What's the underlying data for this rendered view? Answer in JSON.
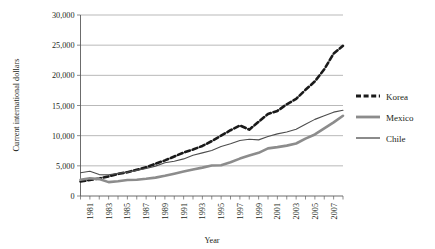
{
  "chart_data": {
    "type": "line",
    "title": "",
    "xlabel": "Year",
    "ylabel": "Current international dollars",
    "xlim": [
      1980,
      2008
    ],
    "ylim": [
      0,
      30000
    ],
    "grid": true,
    "legend_position": "right",
    "x": [
      1980,
      1981,
      1982,
      1983,
      1984,
      1985,
      1986,
      1987,
      1988,
      1989,
      1990,
      1991,
      1992,
      1993,
      1994,
      1995,
      1996,
      1997,
      1998,
      1999,
      2000,
      2001,
      2002,
      2003,
      2004,
      2005,
      2006,
      2007,
      2008
    ],
    "x_tick_labels": [
      "1981",
      "1983",
      "1985",
      "1987",
      "1989",
      "1991",
      "1993",
      "1995",
      "1997",
      "1999",
      "2001",
      "2003",
      "2005",
      "2007"
    ],
    "y_tick_labels": [
      "0",
      "5,000",
      "10,000",
      "15,000",
      "20,000",
      "25,000",
      "30,000"
    ],
    "y_ticks": [
      0,
      5000,
      10000,
      15000,
      20000,
      25000,
      30000
    ],
    "series": [
      {
        "name": "Korea",
        "color": "#1a1a1a",
        "style": "dashed",
        "width": 2.6,
        "values": [
          2400,
          2650,
          2900,
          3250,
          3650,
          3950,
          4350,
          4750,
          5350,
          5900,
          6550,
          7200,
          7700,
          8300,
          9100,
          10000,
          10900,
          11700,
          11000,
          12300,
          13600,
          14100,
          15200,
          16100,
          17600,
          19000,
          21000,
          23600,
          24900
        ]
      },
      {
        "name": "Mexico",
        "color": "#8c8c8c",
        "style": "solid",
        "width": 2.6,
        "values": [
          2700,
          2950,
          2800,
          2300,
          2450,
          2650,
          2700,
          2850,
          3050,
          3350,
          3700,
          4050,
          4400,
          4700,
          5050,
          5100,
          5600,
          6200,
          6700,
          7150,
          7900,
          8100,
          8350,
          8700,
          9500,
          10200,
          11200,
          12200,
          13300
        ]
      },
      {
        "name": "Chile",
        "color": "#4d4d4d",
        "style": "solid",
        "width": 1.1,
        "values": [
          3850,
          4100,
          3550,
          3500,
          3750,
          3950,
          4250,
          4550,
          4950,
          5500,
          5750,
          6150,
          6750,
          7150,
          7550,
          8200,
          8650,
          9200,
          9400,
          9300,
          9850,
          10300,
          10600,
          11050,
          11900,
          12700,
          13300,
          13900,
          14200
        ]
      }
    ],
    "notes": {
      "korea_peak_1997": 14500,
      "korea_dip_1998": 13400,
      "korea_end_2008": 27500,
      "chile_start_1980": 3850,
      "mexico_min_1983": 2300
    }
  },
  "axes": {
    "y_title": "Current international dollars",
    "x_title": "Year"
  },
  "legend": {
    "items": [
      {
        "label": "Korea"
      },
      {
        "label": "Mexico"
      },
      {
        "label": "Chile"
      }
    ]
  }
}
